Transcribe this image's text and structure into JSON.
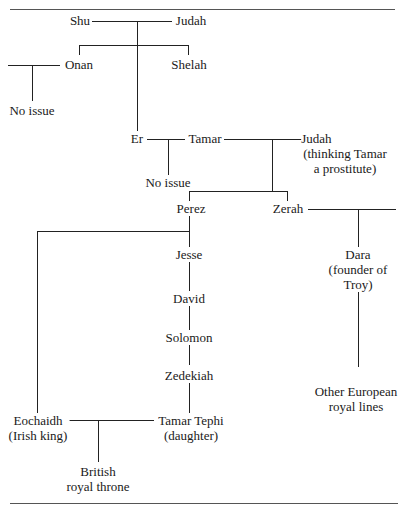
{
  "diagram": {
    "type": "family-tree",
    "nodes": {
      "shu": "Shu",
      "judah_top": "Judah",
      "onan": "Onan",
      "shelah": "Shelah",
      "no_issue_onan": "No issue",
      "er": "Er",
      "tamar": "Tamar",
      "judah_mid": [
        "Judah",
        "(thinking Tamar",
        "a prostitute)"
      ],
      "no_issue_er": "No issue",
      "perez": "Perez",
      "zerah": "Zerah",
      "dara": [
        "Dara",
        "(founder of",
        "Troy)"
      ],
      "jesse": "Jesse",
      "david": "David",
      "solomon": "Solomon",
      "zedekiah": "Zedekiah",
      "other_european": [
        "Other European",
        "royal lines"
      ],
      "eochaidh": [
        "Eochaidh",
        "(Irish king)"
      ],
      "tamar_tephi": [
        "Tamar Tephi",
        "(daughter)"
      ],
      "british_throne": [
        "British",
        "royal throne"
      ]
    },
    "edges": [
      [
        "Shu",
        "Judah",
        "marriage"
      ],
      [
        "Shu+Judah",
        "Onan",
        "child"
      ],
      [
        "Shu+Judah",
        "Shelah",
        "child"
      ],
      [
        "Shu+Judah",
        "Er",
        "child"
      ],
      [
        "Onan",
        "No issue",
        "union-no-children"
      ],
      [
        "Er",
        "Tamar",
        "marriage"
      ],
      [
        "Er+Tamar",
        "No issue",
        "child"
      ],
      [
        "Tamar",
        "Judah",
        "union"
      ],
      [
        "Tamar+Judah",
        "Perez",
        "child"
      ],
      [
        "Tamar+Judah",
        "Zerah",
        "child"
      ],
      [
        "Zerah",
        "Dara",
        "descendant"
      ],
      [
        "Dara",
        "Other European royal lines",
        "descendant"
      ],
      [
        "Perez",
        "Jesse",
        "descendant"
      ],
      [
        "Jesse",
        "David",
        "descendant"
      ],
      [
        "David",
        "Solomon",
        "descendant"
      ],
      [
        "Solomon",
        "Zedekiah",
        "descendant"
      ],
      [
        "Zedekiah",
        "Tamar Tephi",
        "child"
      ],
      [
        "Perez",
        "Eochaidh",
        "descendant"
      ],
      [
        "Eochaidh",
        "Tamar Tephi",
        "marriage"
      ],
      [
        "Eochaidh+Tamar Tephi",
        "British royal throne",
        "descendant"
      ]
    ]
  }
}
